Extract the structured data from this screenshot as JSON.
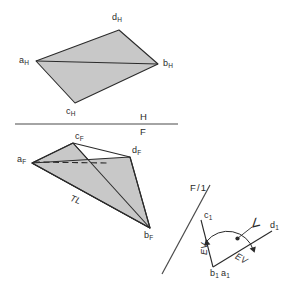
{
  "figure": {
    "type": "descriptive-geometry-orthographic-projection",
    "background_color": "#ffffff",
    "line_color": "#2b2b2b",
    "fill_color": "#c8c8c8",
    "views": {
      "horizontal": {
        "name": "Horizontal (top) view",
        "vertices": {
          "a_H": {
            "x": 36,
            "y": 61
          },
          "b_H": {
            "x": 158,
            "y": 64
          },
          "c_H": {
            "x": 75,
            "y": 103
          },
          "d_H": {
            "x": 119,
            "y": 30
          }
        },
        "labels": {
          "a": "a",
          "a_sub": "H",
          "b": "b",
          "b_sub": "H",
          "c": "c",
          "c_sub": "H",
          "d": "d",
          "d_sub": "H"
        }
      },
      "frontal": {
        "name": "Frontal view",
        "vertices": {
          "a_F": {
            "x": 32,
            "y": 163
          },
          "b_F": {
            "x": 150,
            "y": 228
          },
          "c_F": {
            "x": 73,
            "y": 143
          },
          "d_F": {
            "x": 130,
            "y": 157
          }
        },
        "labels": {
          "a": "a",
          "a_sub": "F",
          "b": "b",
          "b_sub": "F",
          "c": "c",
          "c_sub": "F",
          "d": "d",
          "d_sub": "F",
          "true_length": "TL"
        }
      },
      "auxiliary": {
        "name": "Auxiliary view 1 (edge view)",
        "vertices": {
          "b1a1": {
            "x": 213,
            "y": 267
          },
          "c_1": {
            "x": 202,
            "y": 222
          },
          "d_1": {
            "x": 271,
            "y": 232
          }
        },
        "labels": {
          "c": "c",
          "c_sub": "1",
          "d": "d",
          "d_sub": "1",
          "b_a": "b",
          "b_sub": "1",
          "a": "a",
          "a_sub": "1",
          "edge_view_left": "EV",
          "edge_view_right": "EV",
          "angle_symbol": "∠"
        }
      }
    },
    "fold_lines": {
      "hf": {
        "name": "H/F fold line",
        "x1": 15,
        "y1": 124,
        "x2": 178,
        "y2": 124,
        "label_above": "H",
        "label_below": "F"
      },
      "f1": {
        "name": "F/1 fold line",
        "x1": 208,
        "y1": 188,
        "x2": 163,
        "y2": 272,
        "label": "F/ 1",
        "label_f": "F",
        "label_slash": "/",
        "label_one": "1"
      }
    }
  }
}
